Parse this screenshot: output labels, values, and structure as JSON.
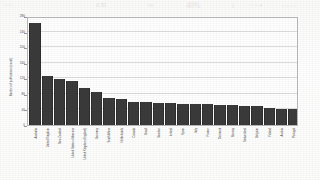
{
  "figure": {
    "caption_visible": false
  },
  "bleed_through": {
    "note": "faint mirrored text showing through scanned paper",
    "lines": [
      {
        "text": "~  ~",
        "x": 4,
        "y": 2,
        "size": 6
      },
      {
        "text": "a  m",
        "x": 96,
        "y": 1,
        "size": 7
      },
      {
        "text": "vn",
        "x": 148,
        "y": 3,
        "size": 5
      },
      {
        "text": "40%",
        "x": 186,
        "y": 1,
        "size": 8
      },
      {
        "text": "f",
        "x": 232,
        "y": 3,
        "size": 6
      },
      {
        "text": "~ ~ e",
        "x": 250,
        "y": 2,
        "size": 6
      },
      {
        "text": "~ ~ ~  ~",
        "x": 282,
        "y": 4,
        "size": 5
      }
    ]
  },
  "chart_data": {
    "type": "bar",
    "title": "",
    "subtitle": "",
    "xlabel": "",
    "ylabel": "Number of publications (count)",
    "ylim": [
      0,
      280
    ],
    "yticks": [
      0,
      40,
      80,
      120,
      160,
      200,
      240,
      280
    ],
    "ytick_labels": [
      "0",
      "40",
      "80",
      "120",
      "160",
      "200",
      "240",
      "280"
    ],
    "grid": true,
    "grid_axis": "y",
    "legend": false,
    "legend_position": "none",
    "bar_color": "#3b3b3b",
    "orientation": "vertical",
    "sorted": "descending",
    "categories": [
      "Australia",
      "United Kingdom",
      "New Zealand",
      "United States of America",
      "United Kingdom (England)",
      "Germany",
      "South Africa",
      "Netherlands",
      "Canada",
      "Brazil",
      "Sweden",
      "Ireland",
      "Spain",
      "Italy",
      "France",
      "Denmark",
      "Norway",
      "Switzerland",
      "Belgium",
      "Finland",
      "Austria",
      "Portugal"
    ],
    "values": [
      262,
      125,
      119,
      113,
      96,
      85,
      70,
      66,
      60,
      59,
      57,
      56,
      55,
      54,
      53,
      52,
      51,
      50,
      48,
      44,
      42,
      40
    ]
  }
}
